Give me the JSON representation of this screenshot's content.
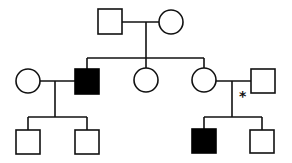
{
  "title": "",
  "colors": {
    "affected": "#000000",
    "unaffected": "#ffffff",
    "line": "#111111"
  },
  "legend": {
    "square": "male",
    "circle": "female",
    "filled": "affected",
    "open": "unaffected"
  },
  "annotation": {
    "symbol": "*",
    "position": "below marriage line between II-4 and II-5"
  },
  "generations": [
    {
      "id": "I",
      "individuals": [
        {
          "id": "I-1",
          "sex": "male",
          "affected": false
        },
        {
          "id": "I-2",
          "sex": "female",
          "affected": false
        }
      ]
    },
    {
      "id": "II",
      "individuals": [
        {
          "id": "II-1",
          "sex": "female",
          "affected": false,
          "married_in": true
        },
        {
          "id": "II-2",
          "sex": "male",
          "affected": true
        },
        {
          "id": "II-3",
          "sex": "female",
          "affected": false
        },
        {
          "id": "II-4",
          "sex": "female",
          "affected": false
        },
        {
          "id": "II-5",
          "sex": "male",
          "affected": false,
          "married_in": true
        }
      ]
    },
    {
      "id": "III",
      "individuals": [
        {
          "id": "III-1",
          "sex": "male",
          "affected": false,
          "parents": [
            "II-1",
            "II-2"
          ]
        },
        {
          "id": "III-2",
          "sex": "male",
          "affected": false,
          "parents": [
            "II-1",
            "II-2"
          ]
        },
        {
          "id": "III-3",
          "sex": "male",
          "affected": true,
          "parents": [
            "II-4",
            "II-5"
          ]
        },
        {
          "id": "III-4",
          "sex": "male",
          "affected": false,
          "parents": [
            "II-4",
            "II-5"
          ]
        }
      ]
    }
  ]
}
